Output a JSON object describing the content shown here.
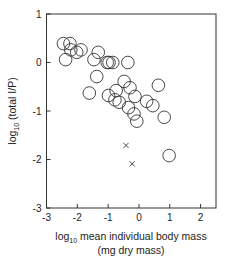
{
  "chart_data": {
    "type": "scatter",
    "title": "",
    "xlabel": {
      "prefix": "log",
      "subscript": "10",
      "text": " mean individual body mass",
      "line2": "(mg dry mass)"
    },
    "ylabel": {
      "prefix": "log",
      "subscript": "10",
      "text": " (total I/P)"
    },
    "xlim": [
      -3,
      2.5
    ],
    "ylim": [
      -3,
      1
    ],
    "xticks": [
      -3,
      -2,
      -1,
      0,
      1,
      2
    ],
    "xtick_labels": [
      "-3",
      "-2",
      "-1",
      "0",
      "1",
      "2"
    ],
    "yticks": [
      -3,
      -2,
      -1,
      0,
      1
    ],
    "ytick_labels": [
      "-3",
      "-2",
      "-1",
      "0",
      "1"
    ],
    "grid": false,
    "series": [
      {
        "name": "circles",
        "marker": "open-circle",
        "points": [
          {
            "x": -2.45,
            "y": 0.39
          },
          {
            "x": -2.24,
            "y": 0.39
          },
          {
            "x": -2.38,
            "y": 0.06
          },
          {
            "x": -2.21,
            "y": 0.26
          },
          {
            "x": -2.02,
            "y": 0.21
          },
          {
            "x": -1.88,
            "y": 0.26
          },
          {
            "x": -1.32,
            "y": 0.21
          },
          {
            "x": -1.46,
            "y": 0.06
          },
          {
            "x": -1.37,
            "y": -0.29
          },
          {
            "x": -1.61,
            "y": -0.63
          },
          {
            "x": -1.03,
            "y": 0.0
          },
          {
            "x": -0.97,
            "y": 0.0
          },
          {
            "x": -0.85,
            "y": 0.0
          },
          {
            "x": -0.36,
            "y": 0.0
          },
          {
            "x": -0.48,
            "y": -0.39
          },
          {
            "x": -0.29,
            "y": -0.52
          },
          {
            "x": -0.13,
            "y": -0.7
          },
          {
            "x": -0.99,
            "y": -0.68
          },
          {
            "x": -0.78,
            "y": -0.77
          },
          {
            "x": -0.74,
            "y": -0.58
          },
          {
            "x": -0.64,
            "y": -0.82
          },
          {
            "x": -0.34,
            "y": -0.93
          },
          {
            "x": -0.16,
            "y": -1.06
          },
          {
            "x": -0.07,
            "y": -1.21
          },
          {
            "x": 0.25,
            "y": -0.8
          },
          {
            "x": 0.45,
            "y": -0.89
          },
          {
            "x": 0.63,
            "y": -0.47
          },
          {
            "x": 0.82,
            "y": -1.13
          },
          {
            "x": 0.98,
            "y": -1.92
          }
        ]
      },
      {
        "name": "crosses",
        "marker": "x",
        "points": [
          {
            "x": -0.42,
            "y": -1.71
          },
          {
            "x": -0.22,
            "y": -2.09
          }
        ]
      }
    ],
    "colors": {
      "marker": "#333333",
      "axis": "#333333"
    }
  }
}
